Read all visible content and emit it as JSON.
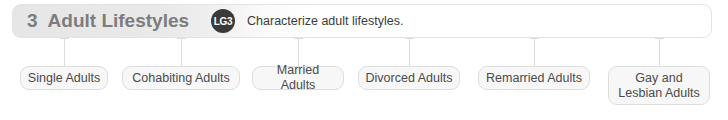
{
  "header": {
    "chapter_number": "3",
    "chapter_title": "Adult Lifestyles",
    "badge_label": "LG3",
    "objective": "Characterize adult lifestyles.",
    "title_color": "#7d7d7d",
    "badge_bg": "#3a3a3a",
    "badge_fg": "#ffffff"
  },
  "nodes": [
    {
      "label": "Single Adults",
      "x": 20,
      "y": 66,
      "w": 88,
      "h": 24,
      "connector_x": 64,
      "connector_top": 38
    },
    {
      "label": "Cohabiting Adults",
      "x": 122,
      "y": 66,
      "w": 118,
      "h": 24,
      "connector_x": 181,
      "connector_top": 38
    },
    {
      "label": "Married Adults",
      "x": 252,
      "y": 66,
      "w": 92,
      "h": 24,
      "connector_x": 298,
      "connector_top": 38
    },
    {
      "label": "Divorced Adults",
      "x": 358,
      "y": 66,
      "w": 102,
      "h": 24,
      "connector_x": 409,
      "connector_top": 38
    },
    {
      "label": "Remarried Adults",
      "x": 478,
      "y": 66,
      "w": 112,
      "h": 24,
      "connector_x": 534,
      "connector_top": 38
    },
    {
      "label": "Gay and Lesbian Adults",
      "x": 608,
      "y": 66,
      "w": 102,
      "h": 39,
      "connector_x": 659,
      "connector_top": 38
    }
  ],
  "colors": {
    "box_fill": "#f7f7f7",
    "box_border": "#dedede",
    "connector": "#dcdcdc",
    "text": "#4a4a4a"
  }
}
